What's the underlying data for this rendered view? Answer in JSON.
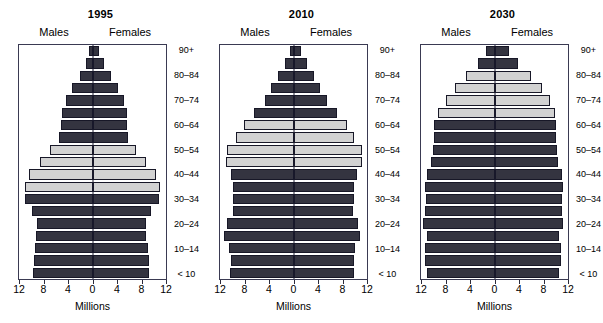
{
  "figure": {
    "axis_title": "Millions",
    "male_header": "Males",
    "female_header": "Females",
    "x_ticks": [
      "12",
      "8",
      "4",
      "0",
      "4",
      "8",
      "12"
    ],
    "x_tick_values": [
      -12,
      -8,
      -4,
      0,
      4,
      8,
      12
    ],
    "xlim": [
      -12,
      12
    ],
    "age_labels": [
      "90+",
      "80–84",
      "70–74",
      "60–64",
      "50–54",
      "40–44",
      "30–34",
      "20–24",
      "10–14",
      "< 10"
    ],
    "colors": {
      "bar_dark": "#343440",
      "bar_light": "#d2d2d2",
      "bar_outline": "#171727",
      "axis": "#3a3a52",
      "text": "#000000",
      "background": "#ffffff"
    },
    "panels": [
      {
        "title": "1995"
      },
      {
        "title": "2010"
      },
      {
        "title": "2030"
      }
    ]
  },
  "chart_data": {
    "type": "bar",
    "subtype": "population-pyramid",
    "xlabel": "Millions",
    "ylabel": "Age group",
    "xlim": [
      -12,
      12
    ],
    "xticks": [
      -12,
      -8,
      -4,
      0,
      4,
      8,
      12
    ],
    "xticklabels": [
      "12",
      "8",
      "4",
      "0",
      "4",
      "8",
      "12"
    ],
    "grid": false,
    "legend": [
      "Males",
      "Females"
    ],
    "legend_position": "top",
    "annotations": [
      "Males",
      "Females"
    ],
    "age_groups": [
      "< 5",
      "5-9",
      "10-14",
      "15-19",
      "20-24",
      "25-29",
      "30-34",
      "35-39",
      "40-44",
      "45-49",
      "50-54",
      "55-59",
      "60-64",
      "65-69",
      "70-74",
      "75-79",
      "80-84",
      "85-89",
      "90+"
    ],
    "age_tick_labels": [
      "90+",
      "80–84",
      "70–74",
      "60–64",
      "50–54",
      "40–44",
      "30–34",
      "20–24",
      "10–14",
      "< 10"
    ],
    "panels": [
      {
        "title": "1995",
        "series": [
          {
            "name": "Males",
            "values": [
              9.7,
              9.6,
              9.4,
              9.2,
              9.0,
              9.8,
              11.0,
              11.1,
              10.4,
              8.6,
              6.9,
              5.5,
              5.2,
              5.0,
              4.4,
              3.3,
              2.1,
              1.1,
              0.5
            ]
          },
          {
            "name": "Females",
            "values": [
              9.3,
              9.2,
              9.0,
              8.8,
              8.7,
              9.5,
              10.8,
              11.0,
              10.3,
              8.7,
              7.1,
              5.8,
              5.7,
              5.7,
              5.2,
              4.2,
              3.0,
              1.9,
              1.0
            ]
          }
        ],
        "highlight_groups": [
          "35-39",
          "40-44",
          "45-49",
          "50-54"
        ],
        "highlight_label": "baby-boom cohort"
      },
      {
        "title": "2010",
        "series": [
          {
            "name": "Males",
            "values": [
              10.3,
              10.2,
              10.6,
              11.3,
              10.8,
              9.9,
              9.9,
              9.9,
              10.2,
              11.0,
              10.9,
              9.4,
              8.1,
              6.4,
              4.7,
              3.6,
              2.5,
              1.4,
              0.6
            ]
          },
          {
            "name": "Females",
            "values": [
              9.9,
              9.8,
              10.1,
              10.9,
              10.5,
              9.7,
              9.8,
              9.9,
              10.3,
              11.2,
              11.2,
              9.8,
              8.7,
              7.1,
              5.5,
              4.4,
              3.4,
              2.2,
              1.3
            ]
          }
        ],
        "highlight_groups": [
          "45-49",
          "50-54",
          "55-59",
          "60-64"
        ],
        "highlight_label": "baby-boom cohort"
      },
      {
        "title": "2030",
        "series": [
          {
            "name": "Males",
            "values": [
              11.0,
              11.4,
              11.4,
              11.0,
              11.6,
              11.3,
              11.2,
              11.3,
              11.1,
              10.4,
              10.1,
              9.9,
              9.8,
              9.3,
              8.0,
              6.4,
              4.6,
              2.7,
              1.4
            ]
          },
          {
            "name": "Females",
            "values": [
              10.6,
              10.9,
              10.9,
              10.6,
              11.2,
              11.0,
              11.0,
              11.2,
              11.0,
              10.4,
              10.2,
              10.1,
              10.0,
              9.8,
              9.0,
              7.7,
              5.9,
              3.8,
              2.3
            ]
          }
        ],
        "highlight_groups": [
          "65-69",
          "70-74",
          "75-79",
          "80-84"
        ],
        "highlight_label": "baby-boom cohort"
      }
    ]
  }
}
